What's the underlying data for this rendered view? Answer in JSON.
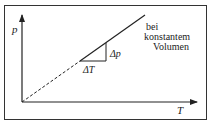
{
  "diagram": {
    "y_axis_label": "p",
    "x_axis_label": "T",
    "annotation_lines": [
      "bei",
      "konstantem",
      "Volumen"
    ],
    "delta_T_label": "ΔT",
    "delta_p_label": "Δp",
    "line_color": "#222222",
    "frame_color": "#333333"
  }
}
